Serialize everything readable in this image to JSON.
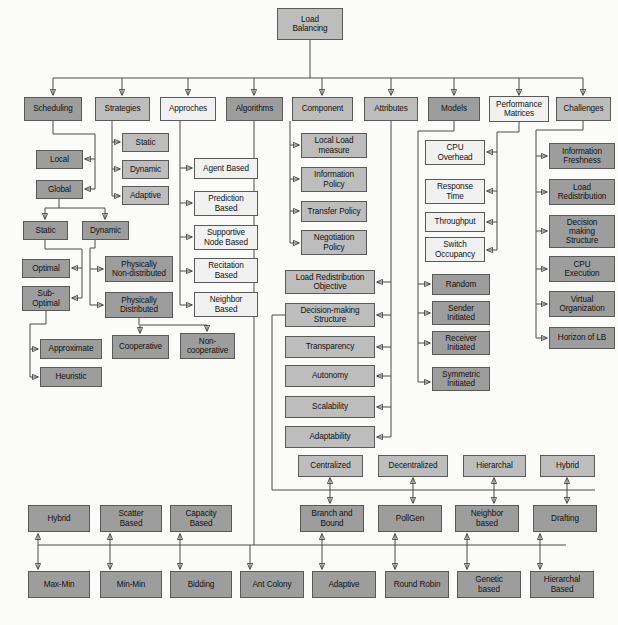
{
  "diagram": {
    "colors": {
      "dark": "#9d9d9d",
      "mid": "#bdbdbd",
      "light": "#f1f1f1",
      "line": "#4a4a4a"
    },
    "root": {
      "label": "Load\nBalancing",
      "x": 277,
      "y": 8,
      "w": 66,
      "h": 32,
      "shade": "sh-mid"
    },
    "level1": [
      {
        "label": "Scheduling",
        "x": 24,
        "y": 97,
        "w": 58,
        "h": 24,
        "shade": "sh-dark"
      },
      {
        "label": "Strategies",
        "x": 95,
        "y": 97,
        "w": 55,
        "h": 24,
        "shade": "sh-mid"
      },
      {
        "label": "Approches",
        "x": 160,
        "y": 97,
        "w": 56,
        "h": 24,
        "shade": "sh-light"
      },
      {
        "label": "Algorithms",
        "x": 226,
        "y": 97,
        "w": 57,
        "h": 24,
        "shade": "sh-dark"
      },
      {
        "label": "Component",
        "x": 292,
        "y": 97,
        "w": 61,
        "h": 24,
        "shade": "sh-mid"
      },
      {
        "label": "Attributes",
        "x": 364,
        "y": 97,
        "w": 54,
        "h": 24,
        "shade": "sh-mid"
      },
      {
        "label": "Models",
        "x": 428,
        "y": 97,
        "w": 52,
        "h": 24,
        "shade": "sh-dark"
      },
      {
        "label": "Performance\nMatrices",
        "x": 489,
        "y": 96,
        "w": 60,
        "h": 26,
        "shade": "sh-light"
      },
      {
        "label": "Challenges",
        "x": 556,
        "y": 97,
        "w": 55,
        "h": 24,
        "shade": "sh-mid"
      }
    ],
    "scheduling_branch": [
      {
        "label": "Local",
        "x": 36,
        "y": 150,
        "w": 47,
        "h": 19,
        "shade": "sh-dark"
      },
      {
        "label": "Global",
        "x": 36,
        "y": 180,
        "w": 47,
        "h": 19,
        "shade": "sh-dark"
      },
      {
        "label": "Static",
        "x": 23,
        "y": 221,
        "w": 45,
        "h": 19,
        "shade": "sh-dark"
      },
      {
        "label": "Dynamic",
        "x": 82,
        "y": 221,
        "w": 47,
        "h": 19,
        "shade": "sh-dark"
      },
      {
        "label": "Optimal",
        "x": 22,
        "y": 259,
        "w": 48,
        "h": 19,
        "shade": "sh-dark"
      },
      {
        "label": "Sub-\nOptimal",
        "x": 22,
        "y": 286,
        "w": 48,
        "h": 25,
        "shade": "sh-dark"
      },
      {
        "label": "Approximate",
        "x": 40,
        "y": 339,
        "w": 62,
        "h": 20,
        "shade": "sh-dark"
      },
      {
        "label": "Heuristic",
        "x": 40,
        "y": 367,
        "w": 62,
        "h": 20,
        "shade": "sh-dark"
      },
      {
        "label": "Physically\nNon-distributed",
        "x": 105,
        "y": 256,
        "w": 68,
        "h": 26,
        "shade": "sh-dark"
      },
      {
        "label": "Physically\nDistributed",
        "x": 105,
        "y": 292,
        "w": 68,
        "h": 26,
        "shade": "sh-dark"
      },
      {
        "label": "Cooperative",
        "x": 112,
        "y": 335,
        "w": 57,
        "h": 24,
        "shade": "sh-dark"
      },
      {
        "label": "Non-\ncooperative",
        "x": 180,
        "y": 333,
        "w": 55,
        "h": 26,
        "shade": "sh-dark"
      }
    ],
    "strategies_branch": [
      {
        "label": "Static",
        "x": 122,
        "y": 133,
        "w": 47,
        "h": 19,
        "shade": "sh-mid"
      },
      {
        "label": "Dynamic",
        "x": 122,
        "y": 160,
        "w": 47,
        "h": 19,
        "shade": "sh-mid"
      },
      {
        "label": "Adaptive",
        "x": 122,
        "y": 186,
        "w": 47,
        "h": 19,
        "shade": "sh-mid"
      }
    ],
    "approaches_branch": [
      {
        "label": "Agent Based",
        "x": 194,
        "y": 158,
        "w": 64,
        "h": 21,
        "shade": "sh-light"
      },
      {
        "label": "Prediction\nBased",
        "x": 194,
        "y": 191,
        "w": 64,
        "h": 25,
        "shade": "sh-light"
      },
      {
        "label": "Supportive\nNode Based",
        "x": 194,
        "y": 225,
        "w": 64,
        "h": 25,
        "shade": "sh-light"
      },
      {
        "label": "Recitation\nBased",
        "x": 194,
        "y": 258,
        "w": 64,
        "h": 25,
        "shade": "sh-light"
      },
      {
        "label": "Neighbor\nBased",
        "x": 194,
        "y": 292,
        "w": 64,
        "h": 25,
        "shade": "sh-light"
      }
    ],
    "component_branch": [
      {
        "label": "Local Load\nmeasure",
        "x": 301,
        "y": 133,
        "w": 66,
        "h": 25,
        "shade": "sh-mid"
      },
      {
        "label": "Information\nPolicy",
        "x": 301,
        "y": 167,
        "w": 66,
        "h": 25,
        "shade": "sh-mid"
      },
      {
        "label": "Transfer Policy",
        "x": 301,
        "y": 201,
        "w": 66,
        "h": 21,
        "shade": "sh-mid"
      },
      {
        "label": "Negotiation\nPolicy",
        "x": 301,
        "y": 230,
        "w": 66,
        "h": 25,
        "shade": "sh-mid"
      }
    ],
    "attributes_branch": [
      {
        "label": "Load Redistribution\nObjective",
        "x": 285,
        "y": 270,
        "w": 90,
        "h": 24,
        "shade": "sh-mid"
      },
      {
        "label": "Decision-making\nStructure",
        "x": 285,
        "y": 303,
        "w": 90,
        "h": 24,
        "shade": "sh-mid"
      },
      {
        "label": "Transparency",
        "x": 285,
        "y": 336,
        "w": 90,
        "h": 22,
        "shade": "sh-mid"
      },
      {
        "label": "Autonomy",
        "x": 285,
        "y": 365,
        "w": 90,
        "h": 22,
        "shade": "sh-mid"
      },
      {
        "label": "Scalability",
        "x": 285,
        "y": 396,
        "w": 90,
        "h": 22,
        "shade": "sh-mid"
      },
      {
        "label": "Adaptability",
        "x": 285,
        "y": 426,
        "w": 90,
        "h": 22,
        "shade": "sh-mid"
      }
    ],
    "models_branch": [
      {
        "label": "Random",
        "x": 432,
        "y": 274,
        "w": 58,
        "h": 21,
        "shade": "sh-dark"
      },
      {
        "label": "Sender\nInitiated",
        "x": 432,
        "y": 301,
        "w": 58,
        "h": 24,
        "shade": "sh-dark"
      },
      {
        "label": "Receiver\nInitiated",
        "x": 432,
        "y": 331,
        "w": 58,
        "h": 24,
        "shade": "sh-dark"
      },
      {
        "label": "Symmetric\nInitiated",
        "x": 432,
        "y": 367,
        "w": 58,
        "h": 24,
        "shade": "sh-dark"
      }
    ],
    "performance_branch": [
      {
        "label": "CPU\nOverhead",
        "x": 425,
        "y": 140,
        "w": 60,
        "h": 25,
        "shade": "sh-light"
      },
      {
        "label": "Response\nTime",
        "x": 425,
        "y": 179,
        "w": 60,
        "h": 25,
        "shade": "sh-light"
      },
      {
        "label": "Throughput",
        "x": 425,
        "y": 212,
        "w": 60,
        "h": 20,
        "shade": "sh-light"
      },
      {
        "label": "Switch\nOccupancy",
        "x": 425,
        "y": 237,
        "w": 60,
        "h": 25,
        "shade": "sh-light"
      }
    ],
    "challenges_branch": [
      {
        "label": "Information\nFreshness",
        "x": 549,
        "y": 143,
        "w": 66,
        "h": 26,
        "shade": "sh-dark"
      },
      {
        "label": "Load\nRedistribution",
        "x": 549,
        "y": 179,
        "w": 66,
        "h": 26,
        "shade": "sh-dark"
      },
      {
        "label": "Decision\nmaking\nStructure",
        "x": 549,
        "y": 215,
        "w": 66,
        "h": 33,
        "shade": "sh-dark"
      },
      {
        "label": "CPU\nExecution",
        "x": 549,
        "y": 256,
        "w": 66,
        "h": 26,
        "shade": "sh-dark"
      },
      {
        "label": "Virtual\nOrganization",
        "x": 549,
        "y": 291,
        "w": 66,
        "h": 26,
        "shade": "sh-dark"
      },
      {
        "label": "Horizon of LB",
        "x": 549,
        "y": 327,
        "w": 66,
        "h": 22,
        "shade": "sh-dark"
      }
    ],
    "structure_row": [
      {
        "label": "Centralized",
        "x": 298,
        "y": 455,
        "w": 65,
        "h": 22,
        "shade": "sh-mid"
      },
      {
        "label": "Decentralized",
        "x": 378,
        "y": 455,
        "w": 70,
        "h": 22,
        "shade": "sh-mid"
      },
      {
        "label": "Hierarchal",
        "x": 463,
        "y": 455,
        "w": 63,
        "h": 22,
        "shade": "sh-mid"
      },
      {
        "label": "Hybrid",
        "x": 540,
        "y": 455,
        "w": 55,
        "h": 22,
        "shade": "sh-mid"
      }
    ],
    "algorithms_row1": [
      {
        "label": "Hybrid",
        "x": 28,
        "y": 505,
        "w": 62,
        "h": 27,
        "shade": "sh-dark"
      },
      {
        "label": "Scatter\nBased",
        "x": 100,
        "y": 505,
        "w": 62,
        "h": 27,
        "shade": "sh-dark"
      },
      {
        "label": "Capacity\nBased",
        "x": 170,
        "y": 505,
        "w": 62,
        "h": 27,
        "shade": "sh-dark"
      },
      {
        "label": "Branch and\nBound",
        "x": 300,
        "y": 505,
        "w": 64,
        "h": 27,
        "shade": "sh-dark"
      },
      {
        "label": "PollGen",
        "x": 378,
        "y": 505,
        "w": 64,
        "h": 27,
        "shade": "sh-dark"
      },
      {
        "label": "Neighbor\nbased",
        "x": 455,
        "y": 505,
        "w": 64,
        "h": 27,
        "shade": "sh-dark"
      },
      {
        "label": "Drafting",
        "x": 533,
        "y": 505,
        "w": 64,
        "h": 27,
        "shade": "sh-dark"
      }
    ],
    "algorithms_row2": [
      {
        "label": "Max-Min",
        "x": 28,
        "y": 571,
        "w": 62,
        "h": 27,
        "shade": "sh-dark"
      },
      {
        "label": "Min-Min",
        "x": 100,
        "y": 571,
        "w": 62,
        "h": 27,
        "shade": "sh-dark"
      },
      {
        "label": "Bidding",
        "x": 170,
        "y": 571,
        "w": 62,
        "h": 27,
        "shade": "sh-dark"
      },
      {
        "label": "Ant Colony",
        "x": 240,
        "y": 571,
        "w": 64,
        "h": 27,
        "shade": "sh-dark"
      },
      {
        "label": "Adaptive",
        "x": 312,
        "y": 571,
        "w": 64,
        "h": 27,
        "shade": "sh-dark"
      },
      {
        "label": "Round Robin",
        "x": 385,
        "y": 571,
        "w": 64,
        "h": 27,
        "shade": "sh-dark"
      },
      {
        "label": "Genetic\nbased",
        "x": 457,
        "y": 571,
        "w": 64,
        "h": 27,
        "shade": "sh-dark"
      },
      {
        "label": "Hierarchal\nBased",
        "x": 530,
        "y": 571,
        "w": 64,
        "h": 27,
        "shade": "sh-dark"
      }
    ]
  }
}
